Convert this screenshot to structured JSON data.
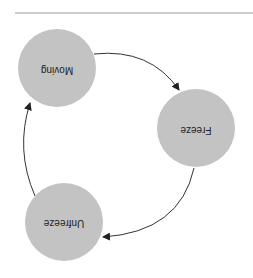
{
  "diagram": {
    "type": "state-cycle",
    "orientation": "rotated-180",
    "divider": {
      "x1": 15,
      "y1": 13,
      "x2": 253,
      "y2": 13,
      "color": "#999999"
    },
    "node_fill": "#c3c3c3",
    "edge_color": "#333333",
    "nodes": [
      {
        "id": "moving",
        "label": "Moving",
        "cx": 57,
        "cy": 68,
        "r": 39
      },
      {
        "id": "freeze",
        "label": "Freeze",
        "cx": 196,
        "cy": 128,
        "r": 39
      },
      {
        "id": "unfreeze",
        "label": "Unfreeze",
        "cx": 64,
        "cy": 222,
        "r": 39
      }
    ],
    "edges": [
      {
        "from": "moving",
        "to": "freeze"
      },
      {
        "from": "freeze",
        "to": "unfreeze"
      },
      {
        "from": "unfreeze",
        "to": "moving"
      }
    ]
  }
}
